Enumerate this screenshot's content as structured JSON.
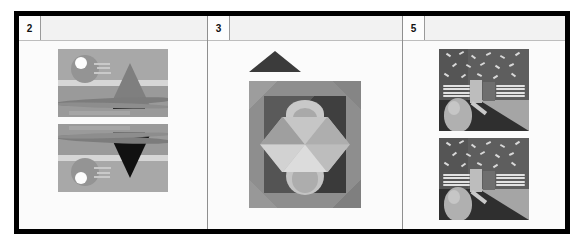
{
  "document": {
    "type": "grid-table",
    "columns": 3,
    "border_color": "#000000",
    "sheet_background": "#fbfbfb",
    "divider_color": "#8f8f8f"
  },
  "cells": [
    {
      "index_label": "2",
      "header_blank": "",
      "artworks": [
        {
          "name": "seascape-sailboat",
          "description": "Grayscale seascape with sun, sailboat sail, hull and wave bands",
          "orientation": "upright"
        },
        {
          "name": "seascape-sailboat-flipped",
          "description": "Same seascape mirrored vertically; sail appears as dark downward triangle and sun at lower right",
          "orientation": "flipped-vertical"
        }
      ]
    },
    {
      "index_label": "3",
      "header_blank": "",
      "artworks": [
        {
          "name": "small-dark-triangle",
          "description": "Small dark grey solid triangle pointing up",
          "orientation": "upright"
        },
        {
          "name": "geometric-mandala",
          "description": "Square beveled frame containing nested dark square, hexagon split into shaded triangles, arc on top and sphere at bottom",
          "orientation": "upright"
        }
      ]
    },
    {
      "index_label": "5",
      "header_blank": "",
      "artworks": [
        {
          "name": "music-note-egg-scene",
          "description": "Abstract grey scene: speckled dark sky, white staff lines, light bar shapes, egg/sphere with long shadow",
          "orientation": "upright"
        },
        {
          "name": "music-note-egg-scene-duplicate",
          "description": "Second identical copy of the abstract music-note and egg scene",
          "orientation": "upright"
        }
      ]
    }
  ],
  "palette": {
    "black": "#000000",
    "sheet": "#fbfbfb",
    "header_fill": "#f2f2f2",
    "mid_grey": "#9b9b9b",
    "dark_grey": "#4c4c4c",
    "light_grey": "#d6d6d6",
    "white": "#ffffff"
  }
}
